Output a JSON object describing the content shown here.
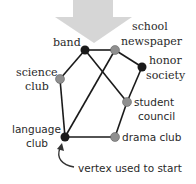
{
  "diagram": {
    "arrow_color": "#c9c9c9",
    "edge_color": "#1a1a1a",
    "vertex_dark_color": "#1a1a1a",
    "vertex_gray_color": "#8f8f8f",
    "vertices": [
      {
        "id": "band",
        "label_lines": [
          "band"
        ],
        "shade": "dark"
      },
      {
        "id": "school-newspaper",
        "label_lines": [
          "school",
          "newspaper"
        ],
        "shade": "gray"
      },
      {
        "id": "honor-society",
        "label_lines": [
          "honor",
          "society"
        ],
        "shade": "dark"
      },
      {
        "id": "science-club",
        "label_lines": [
          "science",
          "club"
        ],
        "shade": "gray"
      },
      {
        "id": "student-council",
        "label_lines": [
          "student",
          "council"
        ],
        "shade": "gray"
      },
      {
        "id": "language-club",
        "label_lines": [
          "language",
          "club"
        ],
        "shade": "dark"
      },
      {
        "id": "drama-club",
        "label_lines": [
          "drama club"
        ],
        "shade": "gray"
      }
    ],
    "edges": [
      [
        "band",
        "school-newspaper"
      ],
      [
        "band",
        "science-club"
      ],
      [
        "band",
        "student-council"
      ],
      [
        "school-newspaper",
        "honor-society"
      ],
      [
        "school-newspaper",
        "language-club"
      ],
      [
        "honor-society",
        "student-council"
      ],
      [
        "science-club",
        "language-club"
      ],
      [
        "student-council",
        "drama-club"
      ],
      [
        "language-club",
        "drama-club"
      ]
    ],
    "annotation": {
      "text": "vertex used to start",
      "points_to": "language-club"
    },
    "labels": {
      "band": "band",
      "school": "school",
      "newspaper": "newspaper",
      "honor": "honor",
      "society": "society",
      "science": "science",
      "science_club": "club",
      "student": "student",
      "council": "council",
      "language": "language",
      "language_club": "club",
      "drama_club": "drama club",
      "start_note": "vertex used to start"
    }
  }
}
